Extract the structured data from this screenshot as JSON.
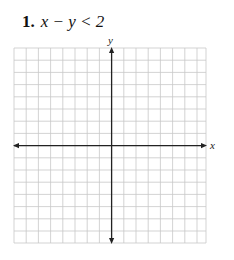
{
  "problem": {
    "number": "1.",
    "expression": "x − y < 2"
  },
  "graph": {
    "x_axis_label": "x",
    "y_axis_label": "y",
    "grid_columns": 16,
    "grid_rows": 16,
    "grid_color": "#c8c8c8",
    "axis_color": "#222222"
  }
}
